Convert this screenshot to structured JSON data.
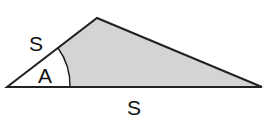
{
  "diagram": {
    "type": "triangle-SAS",
    "labels": {
      "side_left": "S",
      "angle": "A",
      "side_bottom": "S"
    },
    "colors": {
      "fill": "#d4d4d4",
      "stroke": "#222222",
      "angle_region": "#ffffff"
    }
  }
}
